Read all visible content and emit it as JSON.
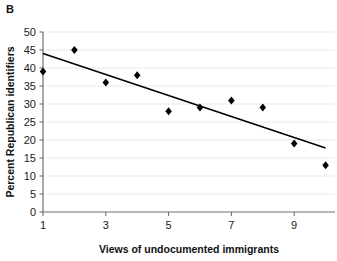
{
  "figure": {
    "panel_label": "B",
    "background_color": "#ffffff",
    "marker_color": "#000000",
    "trendline_color": "#000000",
    "grid_color": "#b9b9b9",
    "axis_color": "#6f6f6f"
  },
  "chart_data": {
    "type": "scatter",
    "title": "",
    "xlabel": "Views of undocumented immigrants",
    "ylabel": "Percent Republican identifiers",
    "x": [
      1,
      2,
      3,
      4,
      5,
      6,
      7,
      8,
      9,
      10
    ],
    "values": [
      39,
      45,
      36,
      38,
      28,
      29,
      31,
      29,
      19,
      13
    ],
    "series": [
      {
        "name": "Percent Republican identifiers",
        "x": [
          1,
          2,
          3,
          4,
          5,
          6,
          7,
          8,
          9,
          10
        ],
        "values": [
          39,
          45,
          36,
          38,
          28,
          29,
          31,
          29,
          19,
          13
        ]
      }
    ],
    "trendline": {
      "type": "linear-fit",
      "x": [
        1,
        10
      ],
      "values": [
        44,
        17.8
      ]
    },
    "xlim": [
      1,
      10.3
    ],
    "ylim": [
      0,
      50
    ],
    "xticks": [
      1,
      3,
      5,
      7,
      9
    ],
    "xticklabels": [
      "1",
      "3",
      "5",
      "7",
      "9"
    ],
    "yticks": [
      0,
      5,
      10,
      15,
      20,
      25,
      30,
      35,
      40,
      45,
      50
    ],
    "yticklabels": [
      "0",
      "5",
      "10",
      "15",
      "20",
      "25",
      "30",
      "35",
      "40",
      "45",
      "50"
    ],
    "grid": "horizontal-dotted",
    "legend": "none",
    "marker": "diamond"
  }
}
